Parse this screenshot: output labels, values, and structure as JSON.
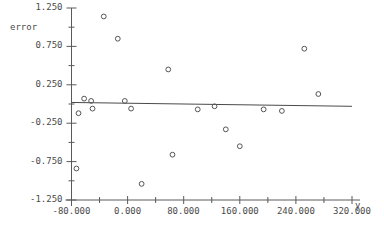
{
  "chart_data": {
    "type": "scatter",
    "title": "",
    "xlabel": "y",
    "ylabel": "error",
    "xlim": [
      -80.0,
      320.0
    ],
    "ylim": [
      -1.25,
      1.25
    ],
    "grid": false,
    "legend": null,
    "x_ticks": [
      -80.0,
      0.0,
      80.0,
      160.0,
      240.0,
      320.0
    ],
    "x_tick_labels": [
      "-80.000",
      "0.000",
      "80.000",
      "160.000",
      "240.000",
      "320.000"
    ],
    "x_minor_ticks": [
      -40.0,
      40.0,
      120.0,
      200.0,
      280.0
    ],
    "y_ticks": [
      1.25,
      0.75,
      0.25,
      -0.25,
      -0.75,
      -1.25
    ],
    "y_tick_labels": [
      "1.250",
      "0.750",
      "0.250",
      "-0.250",
      "-0.750",
      "-1.250"
    ],
    "y_minor_ticks": [
      1.0,
      0.5,
      0.0,
      -0.5,
      -1.0
    ],
    "marker": "open-circle",
    "marker_color": "#555555",
    "points": [
      {
        "x": -73.0,
        "y": -0.84
      },
      {
        "x": -70.0,
        "y": -0.12
      },
      {
        "x": -62.0,
        "y": 0.07
      },
      {
        "x": -52.0,
        "y": 0.04
      },
      {
        "x": -50.0,
        "y": -0.06
      },
      {
        "x": -34.0,
        "y": 1.14
      },
      {
        "x": -14.0,
        "y": 0.85
      },
      {
        "x": -4.0,
        "y": 0.04
      },
      {
        "x": 5.0,
        "y": -0.06
      },
      {
        "x": 20.0,
        "y": -1.04
      },
      {
        "x": 58.0,
        "y": 0.45
      },
      {
        "x": 64.0,
        "y": -0.66
      },
      {
        "x": 100.0,
        "y": -0.07
      },
      {
        "x": 124.0,
        "y": -0.03
      },
      {
        "x": 140.0,
        "y": -0.33
      },
      {
        "x": 160.0,
        "y": -0.55
      },
      {
        "x": 194.0,
        "y": -0.07
      },
      {
        "x": 220.0,
        "y": -0.09
      },
      {
        "x": 252.0,
        "y": 0.72
      },
      {
        "x": 272.0,
        "y": 0.13
      }
    ],
    "fit_line": {
      "x0": -80.0,
      "y0": 0.02,
      "x1": 320.0,
      "y1": -0.03,
      "color": "#4a4a4a"
    }
  },
  "axis": {
    "y_label": "error",
    "x_label": "y"
  }
}
